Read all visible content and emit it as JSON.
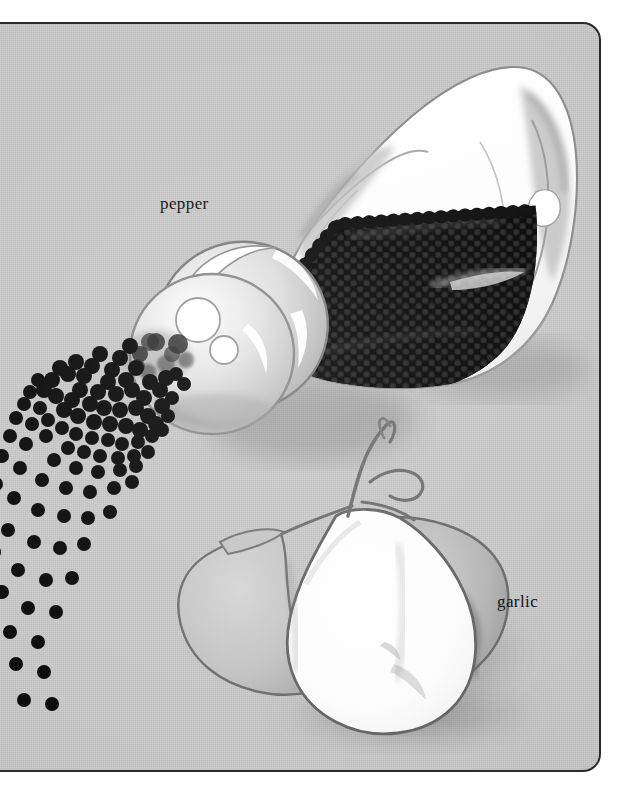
{
  "plate": {
    "background_color": "#c9c9c9",
    "border_color": "#2a2a2a",
    "ink_color": "#10100f",
    "corner_radius_px": 18,
    "cropped_edge": "left"
  },
  "labels": [
    {
      "id": "pepper",
      "text": "pepper",
      "x": 180,
      "y": 170
    },
    {
      "id": "garlic",
      "text": "garlic",
      "x": 517,
      "y": 568
    }
  ],
  "illustration": {
    "medium": "airbrush and pencil illustration",
    "subjects": [
      {
        "name": "pepper-shaker",
        "description": "tilted white glass pepper jar with perforated round cap at lower-left, upper body bright white, lower body filled with dense black peppercorns",
        "label": "pepper",
        "cap_highlight_count": 3
      },
      {
        "name": "peppercorn-spray",
        "description": "black peppercorns scattered from the shaker cap fanning down to the lower-left, dense near the cap and sparse at the far end",
        "dot_count": 92
      },
      {
        "name": "garlic-bulb",
        "description": "garlic head with a large white teardrop center clove, grey side cloves and a curled dried stem at the top, soft cast shadow at lower right",
        "label": "garlic",
        "clove_count": 3
      }
    ]
  },
  "palette": {
    "paper": "#c9c9c9",
    "ink": "#10100f",
    "peppercorn": "#0d0d0d",
    "glass_white": "#fdfdfd",
    "pencil_grey": "#6e6e6e",
    "shadow_grey": "#8d8d8d"
  }
}
